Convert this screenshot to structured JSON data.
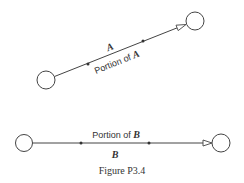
{
  "diagram": {
    "top": {
      "vector_label": "A",
      "portion_label_prefix": "Portion of ",
      "portion_label_var": "A",
      "start_node": {
        "cx": 46,
        "cy": 80,
        "r": 9
      },
      "end_node": {
        "cx": 195,
        "cy": 21,
        "r": 9
      },
      "dots": [
        {
          "x": 88,
          "y": 64
        },
        {
          "x": 143,
          "y": 41
        }
      ]
    },
    "bottom": {
      "vector_label": "B",
      "portion_label_prefix": "Portion of ",
      "portion_label_var": "B",
      "start_node": {
        "cx": 24,
        "cy": 143,
        "r": 8.5
      },
      "end_node": {
        "cx": 221,
        "cy": 143,
        "r": 9
      },
      "dots": [
        {
          "x": 81,
          "y": 143
        },
        {
          "x": 149,
          "y": 143
        }
      ]
    },
    "caption": "Figure P3.4",
    "colors": {
      "stroke": "#444444",
      "text": "#333333"
    }
  }
}
